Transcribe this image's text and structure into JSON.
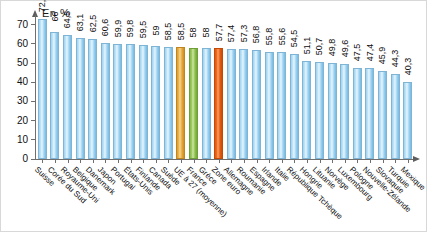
{
  "chart_data": {
    "type": "bar",
    "title": "",
    "subtitle": "",
    "unit_label": "En  %",
    "xlabel": "",
    "ylabel": "En %",
    "ylim": [
      0,
      75
    ],
    "yticks": [
      0,
      10,
      20,
      30,
      40,
      50,
      60,
      70
    ],
    "grid": false,
    "legend": [],
    "categories": [
      "Suisse",
      "Corée du Sud",
      "Royaume-Uni",
      "Belgique",
      "Danemark",
      "Japon",
      "Portugal",
      "États-Unis",
      "Finlande",
      "Canada",
      "Suède",
      "UE à 27 (moyenne)",
      "France",
      "Grèce",
      "Zone euro",
      "Allemagne",
      "Roumanie",
      "Espagne",
      "Irlande",
      "Italie",
      "République Tchèque",
      "Hongrie",
      "Lituanie",
      "Norvège",
      "Luxembourg",
      "Pologne",
      "Nouvelle-Zélande",
      "Slovaquie",
      "Turquie",
      "Mexique"
    ],
    "values": [
      72.7,
      66,
      64.5,
      63.1,
      62.5,
      60.6,
      59.9,
      59.8,
      59.5,
      59,
      58.5,
      58.5,
      58,
      58,
      57.7,
      57.4,
      57.3,
      56.8,
      55.8,
      55.6,
      54.5,
      51.1,
      50.7,
      49.8,
      49.6,
      47.5,
      47.4,
      45.9,
      44.3,
      40.3
    ],
    "value_labels": [
      "72,7",
      "66",
      "64,5",
      "63,1",
      "62,5",
      "60,6",
      "59,9",
      "59,8",
      "59,5",
      "59",
      "58,5",
      "58,5",
      "58",
      "58",
      "57,7",
      "57,4",
      "57,3",
      "56,8",
      "55,8",
      "55,6",
      "54,5",
      "51,1",
      "50,7",
      "49,8",
      "49,6",
      "47,5",
      "47,4",
      "45,9",
      "44,3",
      "40,3"
    ],
    "bar_colors": [
      "blue",
      "blue",
      "blue",
      "blue",
      "blue",
      "blue",
      "blue",
      "blue",
      "blue",
      "blue",
      "blue",
      "gold",
      "green",
      "blue",
      "darkorange",
      "blue",
      "blue",
      "blue",
      "blue",
      "blue",
      "blue",
      "blue",
      "blue",
      "blue",
      "blue",
      "blue",
      "blue",
      "blue",
      "blue",
      "blue"
    ],
    "highlight_colors": {
      "default": "#9ed2f0",
      "eu27": "#e8a531",
      "france": "#8ec04d",
      "eurozone": "#e9610f"
    }
  }
}
